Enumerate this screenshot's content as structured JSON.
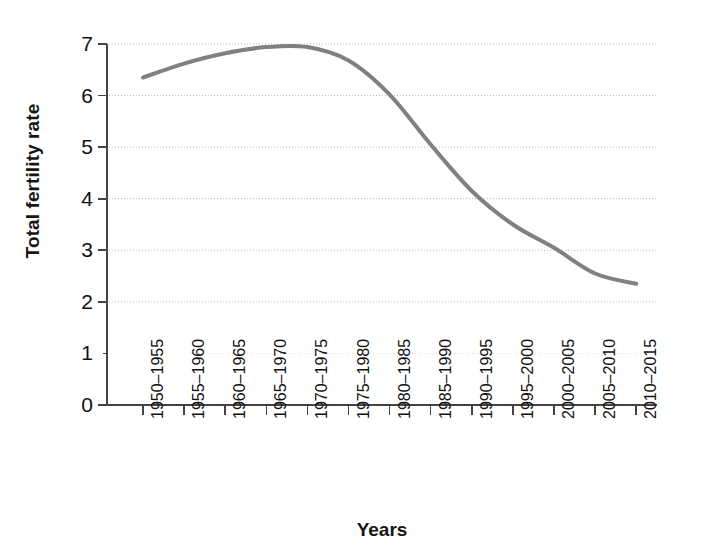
{
  "chart_data": {
    "type": "line",
    "title": "",
    "xlabel": "Years",
    "ylabel": "Total fertility rate",
    "categories": [
      "1950–1955",
      "1955–1960",
      "1960–1965",
      "1965–1970",
      "1970–1975",
      "1975–1980",
      "1980–1985",
      "1985–1990",
      "1990–1995",
      "1995–2000",
      "2000–2005",
      "2005–2010",
      "2010–2015"
    ],
    "values": [
      6.35,
      6.62,
      6.82,
      6.94,
      6.94,
      6.68,
      6.02,
      5.05,
      4.15,
      3.5,
      3.05,
      2.55,
      2.35
    ],
    "series": [
      {
        "name": "Total fertility rate",
        "values": [
          6.35,
          6.62,
          6.82,
          6.94,
          6.94,
          6.68,
          6.02,
          5.05,
          4.15,
          3.5,
          3.05,
          2.55,
          2.35
        ],
        "color": "#808080"
      }
    ],
    "ylim": [
      0,
      7
    ],
    "y_ticks": [
      "0",
      "1",
      "2",
      "3",
      "4",
      "5",
      "6",
      "7"
    ],
    "y_tick_values": [
      0,
      1,
      2,
      3,
      4,
      5,
      6,
      7
    ],
    "grid": true,
    "grid_style": "dotted-horizontal",
    "grid_color": "#b9b9b9",
    "legend": "none",
    "axis_color": "#444444",
    "line_width": 4
  }
}
